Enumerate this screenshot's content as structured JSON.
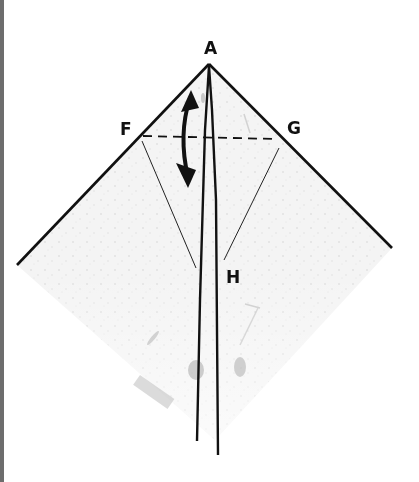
{
  "diagram": {
    "type": "origami-fold-step",
    "labels": {
      "A": "A",
      "F": "F",
      "G": "G",
      "H": "H"
    },
    "elements": {
      "fold_line": "dashed valley fold F–G",
      "arrow": "double-headed curved arrow (fold and unfold)",
      "creases": [
        "thin crease from F toward H",
        "thin crease from G toward H"
      ],
      "center_edges": "two long edges from A to bottom point"
    },
    "colors": {
      "line": "#111111",
      "paper": "#f3f3f3",
      "border": "#6d6d6d"
    }
  }
}
